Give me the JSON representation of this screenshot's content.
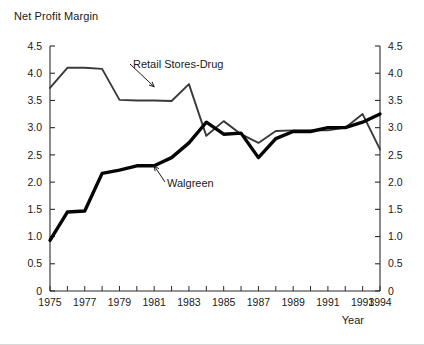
{
  "chart_data": {
    "type": "line",
    "title": "Net Profit Margin",
    "xlabel": "Year",
    "ylabel": "",
    "xlim": [
      1975,
      1994
    ],
    "ylim": [
      0,
      4.5
    ],
    "ytick_labels": [
      "0",
      "0.5",
      "1.0",
      "1.5",
      "2.0",
      "2.5",
      "3.0",
      "3.5",
      "4.0",
      "4.5"
    ],
    "ytick_values": [
      0,
      0.5,
      1.0,
      1.5,
      2.0,
      2.5,
      3.0,
      3.5,
      4.0,
      4.5
    ],
    "xtick_labels": [
      "1975",
      "1977",
      "1979",
      "1981",
      "1983",
      "1985",
      "1987",
      "1989",
      "1991",
      "1993",
      "1994"
    ],
    "xtick_values": [
      1975,
      1977,
      1979,
      1981,
      1983,
      1985,
      1987,
      1989,
      1991,
      1993,
      1994
    ],
    "grid": false,
    "legend_position": "inline-annotation",
    "dual_y_axis": true,
    "x": [
      1975,
      1976,
      1977,
      1978,
      1979,
      1980,
      1981,
      1982,
      1983,
      1984,
      1985,
      1986,
      1987,
      1988,
      1989,
      1990,
      1991,
      1992,
      1993,
      1994
    ],
    "series": [
      {
        "name": "Retail Stores-Drug",
        "style": "thin",
        "color": "#3a3a3a",
        "values": [
          3.73,
          4.1,
          4.1,
          4.08,
          3.51,
          3.5,
          3.5,
          3.49,
          3.8,
          2.85,
          3.12,
          2.88,
          2.72,
          2.94,
          2.95,
          2.95,
          2.95,
          3.0,
          3.25,
          2.6
        ]
      },
      {
        "name": "Walgreen",
        "style": "thick",
        "color": "#050505",
        "values": [
          0.93,
          1.45,
          1.47,
          2.16,
          2.22,
          2.3,
          2.3,
          2.45,
          2.72,
          3.1,
          2.88,
          2.9,
          2.45,
          2.8,
          2.93,
          2.93,
          3.0,
          3.0,
          3.1,
          3.25
        ]
      }
    ],
    "annotations": [
      {
        "text": "Retail Stores-Drug",
        "target_x": 1981,
        "target_y": 3.75
      },
      {
        "text": "Walgreen",
        "target_x": 1981,
        "target_y": 2.3
      }
    ]
  }
}
